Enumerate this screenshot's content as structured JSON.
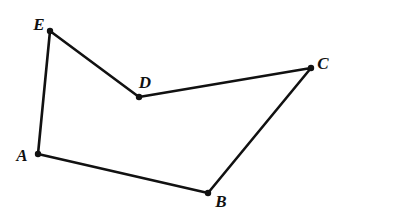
{
  "figure": {
    "background_color": "#ffffff",
    "stroke_color": "#111111",
    "label_color": "#111111",
    "stroke_width": 2.6,
    "vertex_dot_radius": 3.2,
    "canvas": {
      "width": 400,
      "height": 218
    }
  },
  "chart_data": {
    "type": "scatter",
    "xlabel": "",
    "ylabel": "",
    "xlim": [
      0,
      400
    ],
    "ylim": [
      0,
      218
    ],
    "grid": false,
    "legend": "none",
    "points": [
      {
        "label": "A",
        "x": 38,
        "y": 154
      },
      {
        "label": "B",
        "x": 208,
        "y": 193
      },
      {
        "label": "C",
        "x": 311,
        "y": 68
      },
      {
        "label": "D",
        "x": 139,
        "y": 97
      },
      {
        "label": "E",
        "x": 50,
        "y": 31
      }
    ],
    "edges": [
      {
        "from": "A",
        "to": "E"
      },
      {
        "from": "E",
        "to": "D"
      },
      {
        "from": "D",
        "to": "C"
      },
      {
        "from": "C",
        "to": "B"
      },
      {
        "from": "B",
        "to": "A"
      }
    ],
    "path_points": "38,154 50,31 139,97 311,68 208,193",
    "closed": true
  },
  "vertices": [
    {
      "name": "A",
      "label": "A",
      "dot_x": 38,
      "dot_y": 154,
      "label_x": 22,
      "label_y": 155
    },
    {
      "name": "B",
      "label": "B",
      "dot_x": 208,
      "dot_y": 193,
      "label_x": 221,
      "label_y": 201
    },
    {
      "name": "C",
      "label": "C",
      "dot_x": 311,
      "dot_y": 68,
      "label_x": 323,
      "label_y": 63
    },
    {
      "name": "D",
      "label": "D",
      "dot_x": 139,
      "dot_y": 97,
      "label_x": 145,
      "label_y": 82
    },
    {
      "name": "E",
      "label": "E",
      "dot_x": 50,
      "dot_y": 31,
      "label_x": 39,
      "label_y": 24
    }
  ]
}
